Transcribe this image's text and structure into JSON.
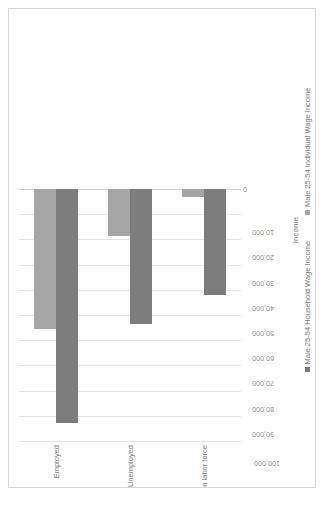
{
  "figure": {
    "frame_border_color": "#d9d9d9",
    "background": "#ffffff",
    "rotation_degrees": -90
  },
  "chart_data": {
    "type": "bar",
    "orientation": "horizontal",
    "title": "",
    "subtitle": "",
    "xlabel": "Income",
    "ylabel": "",
    "categories": [
      "Employed",
      "Unemployed",
      "Not in labor force"
    ],
    "series": [
      {
        "name": "Male 25-54 Household Wage Income",
        "color": "#7d7d7d",
        "values": [
          93000,
          53500,
          42000
        ]
      },
      {
        "name": "Male 25-54 Individual Wage Income",
        "color": "#a6a6a6",
        "values": [
          55500,
          18500,
          3000
        ]
      }
    ],
    "xlim": [
      0,
      100000
    ],
    "tick_values": [
      0,
      10000,
      20000,
      30000,
      40000,
      50000,
      60000,
      70000,
      80000,
      90000,
      100000
    ],
    "tick_labels": [
      "0",
      "10,000",
      "20,000",
      "30,000",
      "40,000",
      "50,000",
      "60,000",
      "70,000",
      "80,000",
      "90,000",
      "100,000"
    ],
    "grid": true,
    "grid_color": "#e6e6e6",
    "legend_position": "bottom"
  },
  "axis": {
    "value_axis_title": "Income",
    "tick_label_color": "#8c8c8c",
    "category_label_color": "#7a7a7a"
  },
  "legend": {
    "entries": [
      {
        "label": "Male 25-54 Household Wage Income",
        "color": "#7d7d7d"
      },
      {
        "label": "Male 25-54 Individual Wage Income",
        "color": "#a6a6a6"
      }
    ]
  }
}
